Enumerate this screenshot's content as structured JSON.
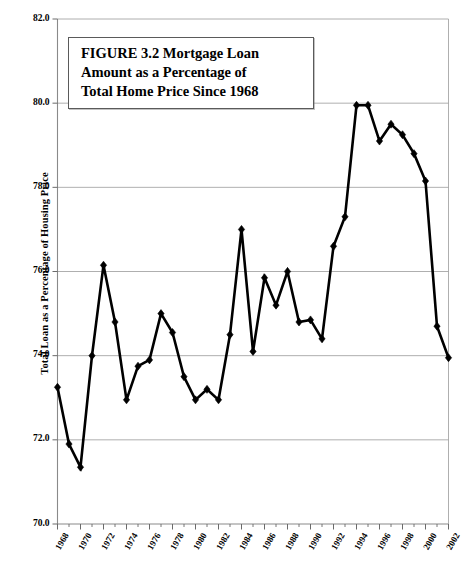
{
  "figure": {
    "title_lines": [
      "FIGURE 3.2  Mortgage Loan",
      "Amount as a Percentage of",
      "Total Home Price Since 1968"
    ],
    "title_full": "FIGURE 3.2 Mortgage Loan Amount as a Percentage of Total Home Price Since 1968"
  },
  "chart_data": {
    "type": "line",
    "title": "FIGURE 3.2  Mortgage Loan Amount as a Percentage of Total Home Price Since 1968",
    "xlabel": "",
    "ylabel": "Total Loan as a Percentage of Housing Price",
    "ylim": [
      70.0,
      82.0
    ],
    "xlim": [
      1968,
      2002
    ],
    "ytick_labels": [
      "82.0",
      "80.0",
      "78.0",
      "76.0",
      "74.0",
      "72.0",
      "70.0"
    ],
    "yticks": [
      82.0,
      80.0,
      78.0,
      76.0,
      74.0,
      72.0,
      70.0
    ],
    "xtick_labels": [
      "1968",
      "1970",
      "1972",
      "1974",
      "1976",
      "1978",
      "1980",
      "1982",
      "1984",
      "1986",
      "1988",
      "1990",
      "1992",
      "1994",
      "1996",
      "1998",
      "2000",
      "2002"
    ],
    "xticks": [
      1968,
      1970,
      1972,
      1974,
      1976,
      1978,
      1980,
      1982,
      1984,
      1986,
      1988,
      1990,
      1992,
      1994,
      1996,
      1998,
      2000,
      2002
    ],
    "grid": true,
    "grid_axis": "y",
    "legend": false,
    "marker": "diamond",
    "line_color": "#000000",
    "marker_color": "#000000",
    "x": [
      1968,
      1969,
      1970,
      1971,
      1972,
      1973,
      1974,
      1975,
      1976,
      1977,
      1978,
      1979,
      1980,
      1981,
      1982,
      1983,
      1984,
      1985,
      1986,
      1987,
      1988,
      1989,
      1990,
      1991,
      1992,
      1993,
      1994,
      1995,
      1996,
      1997,
      1998,
      1999,
      2000,
      2001,
      2002
    ],
    "values": [
      73.25,
      71.9,
      71.35,
      74.0,
      76.15,
      74.8,
      72.95,
      73.75,
      73.9,
      75.0,
      74.55,
      73.5,
      72.95,
      73.2,
      72.95,
      74.5,
      77.0,
      74.1,
      75.85,
      75.2,
      76.0,
      74.8,
      74.85,
      74.4,
      76.6,
      77.3,
      79.95,
      79.95,
      79.1,
      79.5,
      79.25,
      78.8,
      78.15,
      74.7,
      73.95
    ],
    "series": [
      {
        "name": "Total loan as a percentage of housing price",
        "values": [
          73.25,
          71.9,
          71.35,
          74.0,
          76.15,
          74.8,
          72.95,
          73.75,
          73.9,
          75.0,
          74.55,
          73.5,
          72.95,
          73.2,
          72.95,
          74.5,
          77.0,
          74.1,
          75.85,
          75.2,
          76.0,
          74.8,
          74.85,
          74.4,
          76.6,
          77.3,
          79.95,
          79.95,
          79.1,
          79.5,
          79.25,
          78.8,
          78.15,
          74.7,
          73.95
        ]
      }
    ]
  }
}
